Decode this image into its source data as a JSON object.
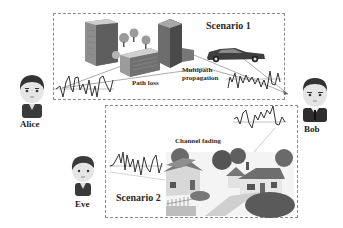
{
  "figure": {
    "background": "#ffffff",
    "palette": {
      "ink": "#2a2a2a",
      "dark": "#444444",
      "mid": "#777777",
      "light": "#bbbbbb",
      "border": "#8a8a8a"
    }
  },
  "actors": {
    "alice": {
      "name": "Alice",
      "icon": "person-avatar-icon"
    },
    "bob": {
      "name": "Bob",
      "icon": "person-avatar-icon"
    },
    "eve": {
      "name": "Eve",
      "icon": "person-avatar-icon"
    }
  },
  "scenario1": {
    "title": "Scenario 1",
    "labels": {
      "path_loss": "Path loss",
      "multipath_line1": "Multipath",
      "multipath_line2": "propagation"
    },
    "elements": [
      "office-buildings-illustration",
      "car-illustration",
      "trees",
      "signal-waveform-tx",
      "signal-waveform-rx",
      "propagation-rays"
    ]
  },
  "scenario2": {
    "title": "Scenario 2",
    "labels": {
      "channel_fading": "Channel fading"
    },
    "elements": [
      "suburban-houses-illustration",
      "signal-waveform-tx",
      "signal-waveform-rx",
      "propagation-ray"
    ]
  }
}
